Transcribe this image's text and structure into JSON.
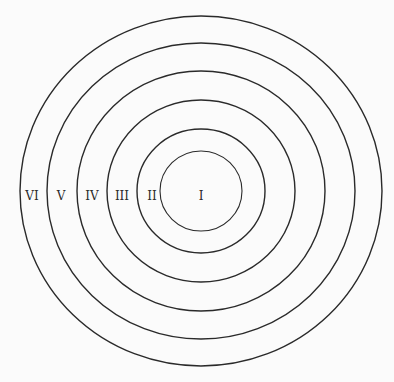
{
  "diagram": {
    "type": "concentric-circles",
    "center": [
      201,
      191
    ],
    "stroke_color": "#2a2a2a",
    "rings": [
      {
        "label": "I",
        "rx": 41,
        "ry": 40,
        "label_x": 201,
        "label_y": 200
      },
      {
        "label": "II",
        "rx": 64,
        "ry": 62,
        "label_x": 152,
        "label_y": 200
      },
      {
        "label": "III",
        "rx": 94,
        "ry": 91,
        "label_x": 122,
        "label_y": 200
      },
      {
        "label": "IV",
        "rx": 124,
        "ry": 120,
        "label_x": 92,
        "label_y": 200
      },
      {
        "label": "V",
        "rx": 154,
        "ry": 148,
        "label_x": 61,
        "label_y": 200
      },
      {
        "label": "VI",
        "rx": 181,
        "ry": 175,
        "label_x": 32,
        "label_y": 200
      }
    ]
  }
}
